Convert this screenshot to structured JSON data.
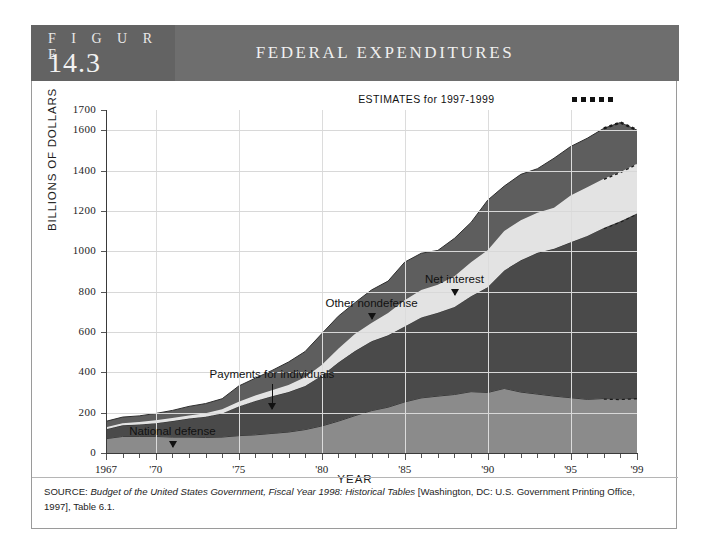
{
  "figure": {
    "label_word": "F I G U R E",
    "number": "14.3",
    "title": "FEDERAL EXPENDITURES"
  },
  "source": {
    "prefix": "SOURCE: ",
    "italic_part": "Budget of the United States Government, Fiscal Year 1998: Historical Tables",
    "rest": " [Washington, DC: U.S. Government Printing Office, 1997], Table 6.1."
  },
  "estimates": {
    "label": "ESTIMATES for 1997-1999",
    "start_year": 1997,
    "end_year": 1999
  },
  "colors": {
    "header_bg": "#6e6e6e",
    "header_left_bg": "#636363",
    "national_defense": "#8b8b8b",
    "payments_for_individuals": "#4a4a4a",
    "net_interest": "#e3e3e3",
    "other_nondefense": "#5e5e5e",
    "axis": "#3a3a3a",
    "gridline": "#d8d8d8"
  },
  "chart_data": {
    "type": "area",
    "title": "FEDERAL EXPENDITURES",
    "xlabel": "YEAR",
    "ylabel": "BILLIONS OF DOLLARS",
    "xlim": [
      1967,
      1999
    ],
    "ylim": [
      0,
      1700
    ],
    "grid": true,
    "legend_position": "annotations",
    "ytick_labels": [
      "0",
      "200",
      "400",
      "600",
      "800",
      "1000",
      "1200",
      "1400",
      "1600",
      "1700"
    ],
    "ytick_values": [
      0,
      200,
      400,
      600,
      800,
      1000,
      1200,
      1400,
      1600,
      1700
    ],
    "xtick_labels": [
      "1967",
      "'70",
      "'75",
      "'80",
      "'85",
      "'90",
      "'95",
      "'99"
    ],
    "xtick_values": [
      1967,
      1970,
      1975,
      1980,
      1985,
      1990,
      1995,
      1999
    ],
    "stacked": true,
    "x": [
      1967,
      1968,
      1969,
      1970,
      1971,
      1972,
      1973,
      1974,
      1975,
      1976,
      1977,
      1978,
      1979,
      1980,
      1981,
      1982,
      1983,
      1984,
      1985,
      1986,
      1987,
      1988,
      1989,
      1990,
      1991,
      1992,
      1993,
      1994,
      1995,
      1996,
      1997,
      1998,
      1999
    ],
    "series": [
      {
        "name": "National defense",
        "color": "#8b8b8b",
        "values": [
          71,
          82,
          82,
          82,
          79,
          79,
          77,
          79,
          86,
          90,
          97,
          104,
          116,
          134,
          158,
          185,
          210,
          227,
          253,
          273,
          282,
          290,
          304,
          300,
          320,
          302,
          292,
          282,
          274,
          266,
          270,
          268,
          272
        ]
      },
      {
        "name": "Payments for individuals",
        "color": "#4a4a4a",
        "values": [
          47,
          55,
          59,
          66,
          79,
          92,
          103,
          117,
          145,
          168,
          184,
          198,
          216,
          249,
          290,
          320,
          344,
          356,
          374,
          399,
          413,
          434,
          473,
          521,
          585,
          653,
          700,
          730,
          770,
          810,
          845,
          880,
          915
        ]
      },
      {
        "name": "Net interest",
        "color": "#e3e3e3",
        "values": [
          10,
          11,
          13,
          14,
          15,
          15,
          17,
          21,
          23,
          27,
          30,
          35,
          43,
          53,
          69,
          85,
          90,
          111,
          130,
          136,
          139,
          152,
          169,
          184,
          195,
          199,
          199,
          203,
          232,
          241,
          244,
          245,
          247
        ]
      },
      {
        "name": "Other nondefense",
        "color": "#5e5e5e",
        "values": [
          29,
          30,
          30,
          34,
          38,
          45,
          48,
          52,
          78,
          86,
          98,
          114,
          128,
          155,
          161,
          155,
          164,
          158,
          189,
          182,
          170,
          188,
          197,
          248,
          223,
          227,
          218,
          246,
          243,
          243,
          250,
          245,
          166
        ]
      }
    ],
    "annotations": [
      {
        "label": "National defense",
        "x_year": 1971,
        "points_to_series": "National defense"
      },
      {
        "label": "Payments for individuals",
        "x_year": 1977,
        "points_to_series": "Payments for individuals"
      },
      {
        "label": "Other nondefense",
        "x_year": 1983,
        "points_to_series": "Other nondefense"
      },
      {
        "label": "Net interest",
        "x_year": 1988,
        "points_to_series": "Net interest"
      }
    ]
  }
}
